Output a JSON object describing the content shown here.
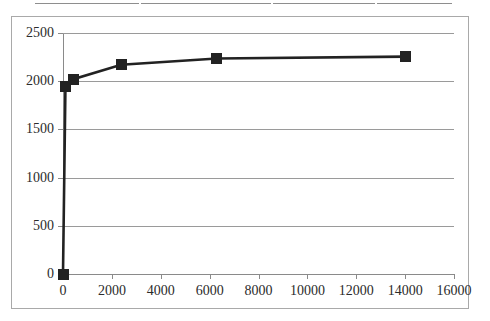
{
  "figure": {
    "scan_rule": {
      "present": true,
      "color": "#8e8e8e"
    },
    "frame_color": "#a9a9a9",
    "background": "#ffffff"
  },
  "chart_data": {
    "type": "line",
    "title": "",
    "subtitle": "",
    "xlabel": "",
    "ylabel": "",
    "xlim": [
      0,
      16000
    ],
    "ylim": [
      0,
      2500
    ],
    "xticks": [
      0,
      2000,
      4000,
      6000,
      8000,
      10000,
      12000,
      14000,
      16000
    ],
    "xtick_labels": [
      "0",
      "2000",
      "4000",
      "6000",
      "8000",
      "10000",
      "12000",
      "14000",
      "16000"
    ],
    "yticks": [
      0,
      500,
      1000,
      1500,
      2000,
      2500
    ],
    "ytick_labels": [
      "0",
      "500",
      "1000",
      "1500",
      "2000",
      "2500"
    ],
    "grid": "horizontal",
    "legend": null,
    "legend_position": "none",
    "series": [
      {
        "name": "series-1",
        "color": "#222222",
        "marker": "square",
        "marker_size": 11,
        "line_width": 2.6,
        "x": [
          0,
          100,
          420,
          2380,
          6300,
          14000
        ],
        "values": [
          0,
          1940,
          2020,
          2170,
          2235,
          2255
        ],
        "points": [
          {
            "x": 0,
            "y": 0
          },
          {
            "x": 100,
            "y": 1940
          },
          {
            "x": 420,
            "y": 2020
          },
          {
            "x": 2380,
            "y": 2170
          },
          {
            "x": 6300,
            "y": 2235
          },
          {
            "x": 14000,
            "y": 2255
          }
        ]
      }
    ]
  }
}
